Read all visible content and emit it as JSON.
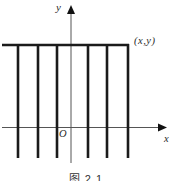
{
  "figure": {
    "caption": "图 2.1",
    "labels": {
      "y_axis": "y",
      "x_axis": "x",
      "origin": "O",
      "point": "(x,y)"
    },
    "colors": {
      "thick_line": "#1b1b1b",
      "axis_line": "#555555",
      "background": "#ffffff"
    },
    "geometry": {
      "width": 172,
      "height": 181,
      "y_axis": {
        "x": 71,
        "y_top": 13,
        "y_bottom": 163,
        "arrow_tip_y": 5,
        "arrow_half_width": 4,
        "arrow_length": 9
      },
      "x_axis": {
        "y": 127.5,
        "x_left": 2,
        "x_right": 158,
        "arrow_tip_x": 167,
        "arrow_half_width": 4,
        "arrow_length": 9
      },
      "top_line": {
        "y": 45,
        "x_left": 2,
        "x_right": 129,
        "thickness": 2.6
      },
      "comb_lines_x": [
        18,
        38,
        57,
        88,
        107,
        128
      ],
      "comb_y_top": 44,
      "comb_y_bottom": 158,
      "comb_thickness": 2.6,
      "axis_thickness": 1
    }
  }
}
